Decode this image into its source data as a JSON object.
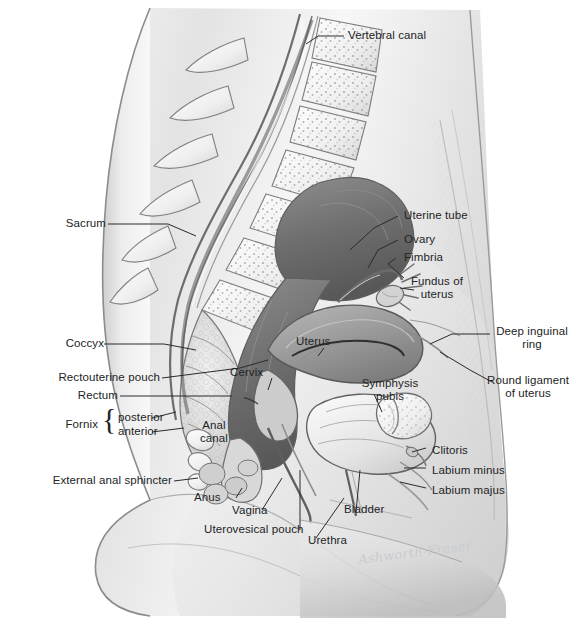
{
  "figure": {
    "background_color": "#ffffff",
    "ink_color": "#222426",
    "signature": "Ashworth-Fraser"
  },
  "labels": {
    "vertebral_canal": "Vertebral canal",
    "sacrum": "Sacrum",
    "uterine_tube": "Uterine tube",
    "ovary": "Ovary",
    "fimbria": "Fimbria",
    "fundus_of_uterus": "Fundus of\nuterus",
    "deep_inguinal_ring": "Deep inguinal\nring",
    "round_ligament_of_uterus": "Round ligament\nof uterus",
    "coccyx": "Coccyx",
    "rectouterine_pouch": "Rectouterine pouch",
    "rectum": "Rectum",
    "fornix": "Fornix",
    "fornix_posterior": "posterior",
    "fornix_anterior": "anterior",
    "external_anal_sphincter": "External anal sphincter",
    "anus": "Anus",
    "vagina": "Vagina",
    "uterovesical_pouch": "Uterovesical pouch",
    "urethra": "Urethra",
    "uterus": "Uterus",
    "cervix": "Cervix",
    "anal_canal": "Anal\ncanal",
    "symphysis_pubis": "Symphysis\npubis",
    "bladder": "Bladder",
    "clitoris": "Clitoris",
    "labium_minus": "Labium minus",
    "labium_majus": "Labium majus"
  }
}
